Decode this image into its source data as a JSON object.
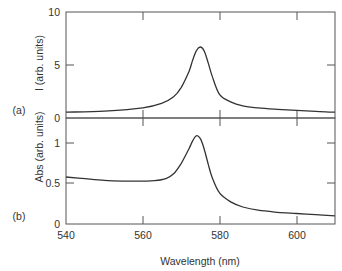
{
  "chart_data": [
    {
      "panel_label": "(a)",
      "type": "line",
      "title": "",
      "xlabel": "Wavelength (nm)",
      "ylabel": "I (arb. units)",
      "xlim": [
        540,
        610
      ],
      "ylim": [
        0,
        10
      ],
      "x_ticks": [
        540,
        560,
        580,
        600
      ],
      "y_ticks": [
        0,
        5,
        10
      ],
      "grid": false,
      "legend": "none",
      "series": [
        {
          "name": "I",
          "x": [
            540,
            550,
            560,
            565,
            568,
            570,
            572,
            573,
            574,
            575,
            576,
            577,
            578,
            580,
            583,
            586,
            590,
            595,
            600,
            605,
            610
          ],
          "y": [
            0.55,
            0.65,
            0.95,
            1.4,
            2.0,
            2.9,
            4.4,
            5.5,
            6.4,
            6.7,
            6.3,
            5.2,
            4.0,
            2.2,
            1.5,
            1.15,
            0.95,
            0.82,
            0.72,
            0.62,
            0.55
          ]
        }
      ]
    },
    {
      "panel_label": "(b)",
      "type": "line",
      "title": "",
      "xlabel": "Wavelength (nm)",
      "ylabel": "Abs (arb. units)",
      "xlim": [
        540,
        610
      ],
      "ylim": [
        0,
        1.2
      ],
      "x_ticks": [
        540,
        560,
        580,
        600
      ],
      "y_ticks": [
        0,
        0.5,
        1
      ],
      "grid": false,
      "legend": "none",
      "series": [
        {
          "name": "Abs",
          "x": [
            540,
            545,
            550,
            555,
            560,
            563,
            566,
            568,
            570,
            572,
            573,
            574,
            575,
            576,
            577,
            578,
            580,
            583,
            586,
            590,
            595,
            600,
            605,
            610
          ],
          "y": [
            0.58,
            0.56,
            0.54,
            0.53,
            0.53,
            0.535,
            0.56,
            0.62,
            0.75,
            0.93,
            1.03,
            1.09,
            1.05,
            0.92,
            0.74,
            0.58,
            0.38,
            0.27,
            0.21,
            0.17,
            0.145,
            0.13,
            0.115,
            0.1
          ]
        }
      ]
    }
  ],
  "labels": {
    "panel_a": "(a)",
    "panel_b": "(b)",
    "ylabel_a": "I (arb. units)",
    "ylabel_b": "Abs (arb. units)",
    "xlabel": "Wavelength (nm)",
    "a_ytick_0": "0",
    "a_ytick_5": "5",
    "a_ytick_10": "10",
    "b_ytick_0": "0",
    "b_ytick_05": "0.5",
    "b_ytick_1": "1",
    "xtick_540": "540",
    "xtick_560": "560",
    "xtick_580": "580",
    "xtick_600": "600"
  },
  "colors": {
    "axis": "#555555",
    "curve": "#333333"
  }
}
